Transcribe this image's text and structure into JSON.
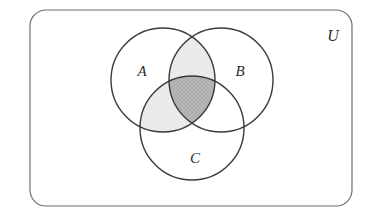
{
  "diagram": {
    "title_text": "Venn diagram of three sets",
    "universe": {
      "label": "U",
      "x": 30,
      "y": 10,
      "width": 322,
      "height": 196,
      "corner_radius": 16,
      "stroke_color": "#6e6e6e",
      "fill_color": "#ffffff",
      "label_x": 333,
      "label_y": 41
    },
    "sets": [
      {
        "id": "A",
        "label": "A",
        "cx": 163,
        "cy": 80,
        "r": 52,
        "label_x": 142,
        "label_y": 76,
        "stroke_color": "#3a3a3a"
      },
      {
        "id": "B",
        "label": "B",
        "cx": 221,
        "cy": 80,
        "r": 52,
        "label_x": 240,
        "label_y": 76,
        "stroke_color": "#3a3a3a"
      },
      {
        "id": "C",
        "label": "C",
        "cx": 192,
        "cy": 128,
        "r": 52,
        "label_x": 195,
        "label_y": 163,
        "stroke_color": "#3a3a3a"
      }
    ],
    "shaded_regions": [
      {
        "id": "A-and-B-only",
        "name": "intersection-a-b-not-c",
        "description": "A ∩ B minus C",
        "fill_color": "#e6e6e6",
        "pattern": "light-hatch",
        "shaded": true
      },
      {
        "id": "A-and-C-only",
        "name": "intersection-a-c-not-b",
        "description": "A ∩ C minus B",
        "fill_color": "#ececec",
        "pattern": "light-hatch",
        "shaded": true
      },
      {
        "id": "A-and-B-and-C",
        "name": "intersection-a-b-c",
        "description": "A ∩ B ∩ C",
        "fill_color": "#b9b9b9",
        "pattern": "cross-hatch",
        "shaded": true
      },
      {
        "id": "B-and-C-only",
        "name": "intersection-b-c-not-a",
        "description": "B ∩ C minus A",
        "fill_color": "#ffffff",
        "pattern": "none",
        "shaded": false
      }
    ],
    "shaded_expression": "A ∩ (B ∪ C)",
    "colors": {
      "light_shade": "#e9e9e9",
      "dark_shade": "#b9b9b9",
      "circle_stroke": "#3a3a3a",
      "universe_stroke": "#6e6e6e",
      "background": "#ffffff",
      "label_color": "#2b2b2b"
    }
  }
}
